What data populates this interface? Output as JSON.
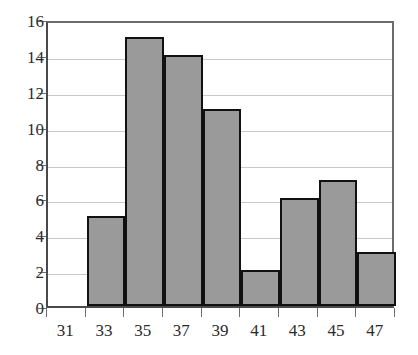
{
  "chart_data": {
    "type": "bar",
    "title": "",
    "subtitle": "",
    "xlabel": "",
    "ylabel": "",
    "categories": [
      "31",
      "33",
      "35",
      "37",
      "39",
      "41",
      "43",
      "45",
      "47"
    ],
    "values": [
      0,
      5,
      15,
      14,
      11,
      2,
      6,
      7,
      3
    ],
    "ylim": [
      0,
      16
    ],
    "ytick_labels": [
      "0",
      "2",
      "4",
      "6",
      "8",
      "10",
      "12",
      "14",
      "16"
    ],
    "ytick_values": [
      0,
      2,
      4,
      6,
      8,
      10,
      12,
      14,
      16
    ],
    "grid": true,
    "grid_axis": "y",
    "legend": false,
    "legend_position": "none",
    "annotations": [],
    "colors": {
      "bar_fill": "#9a9a9a",
      "bar_edge": "#111111",
      "gridline": "#c9c9c9",
      "axis_line": "#4a4a4a",
      "plot_border": "#6b6b6b",
      "tick_mark": "#6f6f6f",
      "text": "#2b2b2b",
      "background": "#ffffff"
    }
  }
}
